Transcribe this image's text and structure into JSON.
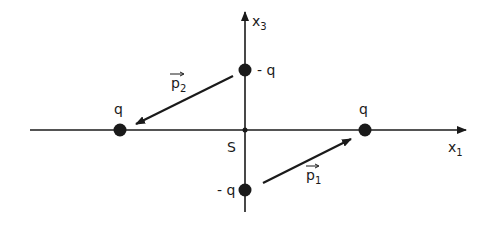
{
  "diagram": {
    "axes": {
      "horizontal_label": "x",
      "horizontal_sub": "1",
      "vertical_label": "x",
      "vertical_sub": "3",
      "origin_label": "S"
    },
    "charges": [
      {
        "id": "top",
        "label": "- q"
      },
      {
        "id": "left",
        "label": "q"
      },
      {
        "id": "right",
        "label": "q"
      },
      {
        "id": "bottom",
        "label": "- q"
      }
    ],
    "vectors": [
      {
        "id": "p1",
        "label": "p",
        "sub": "1"
      },
      {
        "id": "p2",
        "label": "p",
        "sub": "2"
      }
    ],
    "colors": {
      "ink": "#1a1a1a",
      "background": "#ffffff"
    }
  }
}
